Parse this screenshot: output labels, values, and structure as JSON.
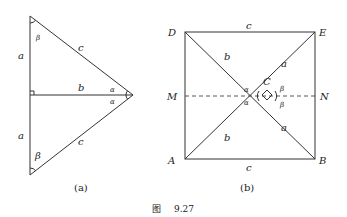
{
  "figure": {
    "caption_prefix": "图",
    "caption_number": "9.27"
  },
  "panel_a": {
    "caption": "(a)",
    "labels": {
      "a_top": "a",
      "a_bottom": "a",
      "b": "b",
      "c_top": "c",
      "c_bottom": "c",
      "alpha_top": "α",
      "alpha_bottom": "α",
      "beta_top": "β",
      "beta_bottom": "β"
    }
  },
  "panel_b": {
    "caption": "(b)",
    "points": {
      "D": "D",
      "E": "E",
      "A": "A",
      "B": "B",
      "C": "C",
      "M": "M",
      "N": "N"
    },
    "labels": {
      "c_top": "c",
      "c_bottom": "c",
      "b_upper": "b",
      "b_lower": "b",
      "a_upper": "a",
      "a_lower": "a",
      "alpha_upper": "α",
      "alpha_lower": "α",
      "beta_upper": "β",
      "beta_lower": "β"
    }
  }
}
